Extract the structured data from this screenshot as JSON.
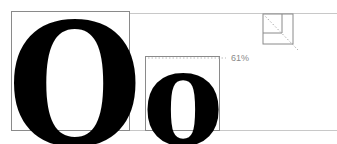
{
  "diagram": {
    "title": "",
    "uppercase_glyph": "O",
    "lowercase_glyph": "o",
    "ratio_label": "61%",
    "ratio_value": 61,
    "colors": {
      "glyph": "#000000",
      "box_stroke": "#8a8a8a",
      "guide_line": "#c8c8c8",
      "label": "#8a8a8a"
    },
    "icon": "proportion-square-icon"
  }
}
